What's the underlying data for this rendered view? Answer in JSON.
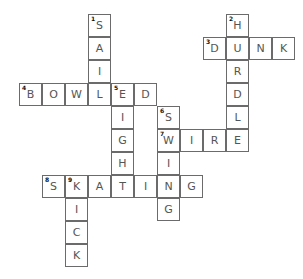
{
  "puzzle": {
    "type": "crossword",
    "cell_size": 23,
    "origin": {
      "x": 19,
      "y": 14
    },
    "words": [
      {
        "number": 1,
        "direction": "down",
        "answer": "SAIL",
        "col": 3,
        "row": 0
      },
      {
        "number": 2,
        "direction": "down",
        "answer": "HURDLE",
        "col": 9,
        "row": 0
      },
      {
        "number": 3,
        "direction": "across",
        "answer": "DUNK",
        "col": 8,
        "row": 1
      },
      {
        "number": 4,
        "direction": "across",
        "answer": "BOWLED",
        "col": 0,
        "row": 3
      },
      {
        "number": 5,
        "direction": "down",
        "answer": "EIGHT",
        "col": 4,
        "row": 3
      },
      {
        "number": 6,
        "direction": "down",
        "answer": "SWING",
        "col": 6,
        "row": 4
      },
      {
        "number": 7,
        "direction": "across",
        "answer": "WIRE",
        "col": 6,
        "row": 5
      },
      {
        "number": 8,
        "direction": "across",
        "answer": "SKATING",
        "col": 1,
        "row": 7
      },
      {
        "number": 9,
        "direction": "down",
        "answer": "KICK",
        "col": 2,
        "row": 7
      }
    ]
  },
  "colors": {
    "border": "#6b6b6b",
    "letter": "#555555",
    "background": "#ffffff"
  }
}
